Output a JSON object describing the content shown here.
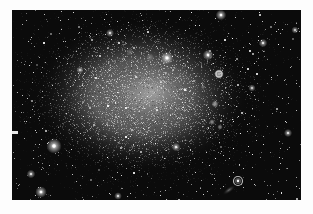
{
  "image": {
    "description": "Black-and-white astrophotograph of an irregular dwarf galaxy resolved into a granular cloud of stars, surrounded by a dark star field, printed with a white page margin",
    "page": {
      "width": 313,
      "height": 214,
      "background_color": "#fdfdfd"
    },
    "photo": {
      "x": 12,
      "y": 10,
      "width": 289,
      "height": 190,
      "sky_color": "#0b0b0b"
    },
    "galaxy": {
      "center_x": 130,
      "center_y": 86,
      "radius_x": 112,
      "radius_y": 80,
      "halo_color_rgb": [
        150,
        150,
        150
      ],
      "core_center_x": 141,
      "core_center_y": 82,
      "core_radius_x": 58,
      "core_radius_y": 44,
      "core_color_rgb": [
        186,
        186,
        186
      ],
      "grain_count": 6500,
      "grain_seed": 1337,
      "speck_count": 90
    },
    "field_stars": {
      "count": 720,
      "seed": 9001,
      "color": "#ffffff"
    },
    "bright_stars": [
      {
        "x": 42,
        "y": 136,
        "r": 3.2,
        "b": 1.0
      },
      {
        "x": 19,
        "y": 164,
        "r": 1.8,
        "b": 0.8
      },
      {
        "x": 29,
        "y": 182,
        "r": 2.4,
        "b": 0.95
      },
      {
        "x": 155,
        "y": 48,
        "r": 2.6,
        "b": 1.0
      },
      {
        "x": 196,
        "y": 45,
        "r": 2.2,
        "b": 0.9
      },
      {
        "x": 209,
        "y": 5,
        "r": 2.2,
        "b": 0.95
      },
      {
        "x": 164,
        "y": 137,
        "r": 1.8,
        "b": 0.85
      },
      {
        "x": 98,
        "y": 23,
        "r": 1.7,
        "b": 0.8
      },
      {
        "x": 276,
        "y": 123,
        "r": 1.7,
        "b": 0.85
      },
      {
        "x": 251,
        "y": 33,
        "r": 1.8,
        "b": 0.85
      },
      {
        "x": 283,
        "y": 20,
        "r": 1.5,
        "b": 0.8
      },
      {
        "x": 240,
        "y": 78,
        "r": 1.5,
        "b": 0.8
      },
      {
        "x": 106,
        "y": 186,
        "r": 1.6,
        "b": 0.8
      },
      {
        "x": 68,
        "y": 60,
        "r": 1.5,
        "b": 0.75
      }
    ],
    "nebula_knots": [
      {
        "x": 207,
        "y": 64,
        "r": 5.5,
        "a": 0.85,
        "ring": true
      },
      {
        "x": 203,
        "y": 94,
        "r": 4.0,
        "a": 0.7,
        "ring": false
      },
      {
        "x": 200,
        "y": 112,
        "r": 3.2,
        "a": 0.65,
        "ring": false
      },
      {
        "x": 208,
        "y": 117,
        "r": 3.0,
        "a": 0.6,
        "ring": false
      },
      {
        "x": 191,
        "y": 77,
        "r": 2.5,
        "a": 0.4,
        "ring": false
      },
      {
        "x": 138,
        "y": 47,
        "r": 4.5,
        "a": 0.35,
        "ring": false
      },
      {
        "x": 118,
        "y": 42,
        "r": 4.0,
        "a": 0.3,
        "ring": false
      }
    ],
    "ring_object": {
      "x": 226,
      "y": 171,
      "outer_r": 4.5,
      "core_r": 1.4,
      "tail_x": 217,
      "tail_y": 180,
      "tail_rx": 8,
      "tail_ry": 3,
      "tail_angle_deg": -35
    },
    "edge_mark": {
      "x": 0,
      "y": 121,
      "width": 6,
      "height": 3,
      "color": "#e9e9e9"
    }
  }
}
